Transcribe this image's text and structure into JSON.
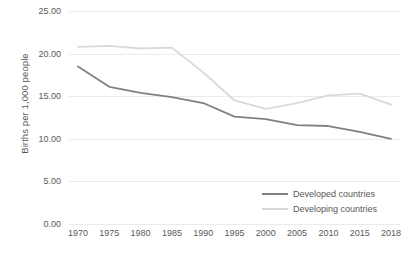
{
  "chart_data": {
    "type": "line",
    "title": "",
    "xlabel": "",
    "ylabel": "Births per 1,000 people",
    "categories": [
      "1970",
      "1975",
      "1980",
      "1985",
      "1990",
      "1995",
      "2000",
      "2005",
      "2010",
      "2015",
      "2018"
    ],
    "ylim": [
      0,
      25
    ],
    "ytick_values": [
      0,
      5,
      10,
      15,
      20,
      25
    ],
    "ytick_labels": [
      "0.00",
      "5.00",
      "10.00",
      "15.00",
      "20.00",
      "25.00"
    ],
    "grid": true,
    "legend_position": "inside-bottom-right",
    "series": [
      {
        "name": "Developed countries",
        "color": "#808080",
        "values": [
          18.5,
          16.1,
          15.4,
          14.9,
          14.2,
          12.6,
          12.3,
          11.6,
          11.5,
          10.8,
          10.0
        ]
      },
      {
        "name": "Developing countries",
        "color": "#d9d9d9",
        "values": [
          20.8,
          20.9,
          20.6,
          20.7,
          17.8,
          14.5,
          13.5,
          14.2,
          15.1,
          15.3,
          14.0
        ]
      }
    ]
  },
  "colors": {
    "gridline": "#ebebeb",
    "text": "#595959",
    "background": "#ffffff"
  }
}
